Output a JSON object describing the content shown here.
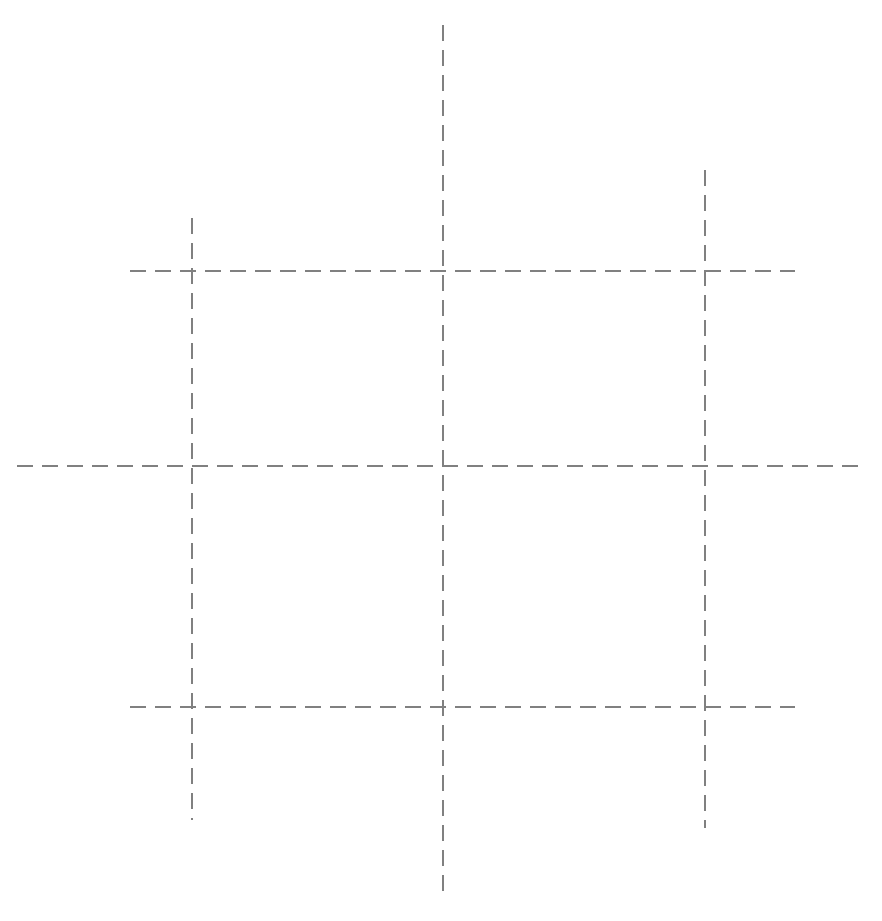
{
  "canvas": {
    "width": 882,
    "height": 921,
    "background_color": "#ffffff",
    "title": "Dashed grid guide lines"
  },
  "style": {
    "line_color": "#808080",
    "line_width": 1.5,
    "dash_length": 16,
    "gap_length": 9,
    "dash_array": "16 9",
    "line_cap": "butt"
  },
  "chart_data": {
    "type": "line",
    "subtitle": "",
    "xlabel": "",
    "ylabel": "",
    "xlim": [
      0,
      882
    ],
    "ylim": [
      0,
      921
    ],
    "grid": true,
    "legend": "none",
    "tick_labels_x": [],
    "tick_labels_y": [],
    "annotations": [],
    "series": [
      {
        "name": "vertical-line-left",
        "orientation": "vertical",
        "x": 192,
        "y_start": 218,
        "y_end": 820,
        "values": [
          192,
          218,
          192,
          820
        ]
      },
      {
        "name": "vertical-line-center",
        "orientation": "vertical",
        "x": 443,
        "y_start": 25,
        "y_end": 900,
        "values": [
          443,
          25,
          443,
          900
        ]
      },
      {
        "name": "vertical-line-right",
        "orientation": "vertical",
        "x": 705,
        "y_start": 170,
        "y_end": 828,
        "values": [
          705,
          170,
          705,
          828
        ]
      },
      {
        "name": "horizontal-line-top",
        "orientation": "horizontal",
        "y": 271,
        "x_start": 130,
        "x_end": 795,
        "values": [
          130,
          271,
          795,
          271
        ]
      },
      {
        "name": "horizontal-line-middle",
        "orientation": "horizontal",
        "y": 466,
        "x_start": 17,
        "x_end": 866,
        "values": [
          17,
          466,
          866,
          466
        ]
      },
      {
        "name": "horizontal-line-bottom",
        "orientation": "horizontal",
        "y": 707,
        "x_start": 130,
        "x_end": 795,
        "values": [
          130,
          707,
          795,
          707
        ]
      }
    ],
    "intersections": [
      {
        "name": "top-left",
        "x": 192,
        "y": 271
      },
      {
        "name": "top-center",
        "x": 443,
        "y": 271
      },
      {
        "name": "top-right",
        "x": 705,
        "y": 271
      },
      {
        "name": "middle-left",
        "x": 192,
        "y": 466
      },
      {
        "name": "middle-center",
        "x": 443,
        "y": 466
      },
      {
        "name": "middle-right",
        "x": 705,
        "y": 466
      },
      {
        "name": "bottom-left",
        "x": 192,
        "y": 707
      },
      {
        "name": "bottom-center",
        "x": 443,
        "y": 707
      },
      {
        "name": "bottom-right",
        "x": 705,
        "y": 707
      }
    ]
  }
}
